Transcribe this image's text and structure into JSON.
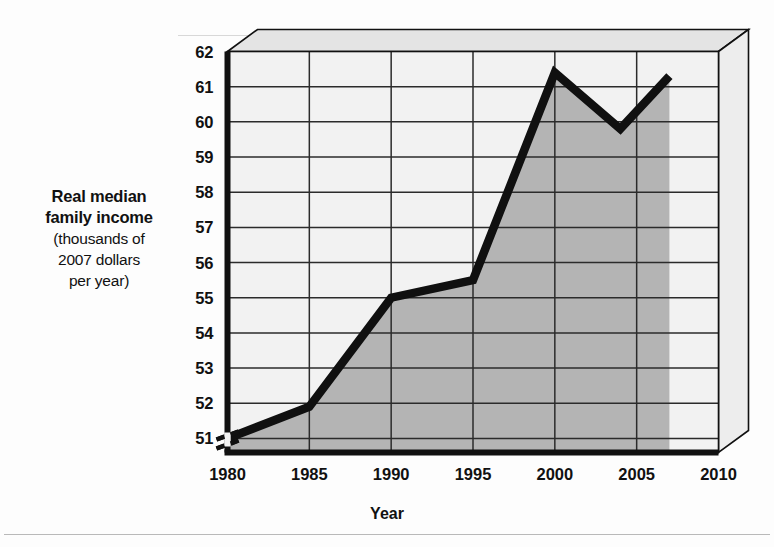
{
  "axes": {
    "y_title_bold": "Real median",
    "y_title_bold2": "family income",
    "y_title_plain1": "(thousands of",
    "y_title_plain2": "2007 dollars",
    "y_title_plain3": "per year)",
    "x_title": "Year"
  },
  "colors": {
    "line": "#101010",
    "fill": "#b4b4b4",
    "plot_background": "#f2f2f2",
    "bevel_top": "#e4e4e4",
    "bevel_side": "#ededed",
    "axis": "#111111",
    "grid": "#2b2b2b"
  },
  "chart_data": {
    "type": "area",
    "title": "",
    "xlabel": "Year",
    "ylabel": "Real median family income (thousands of 2007 dollars per year)",
    "x": [
      1980,
      1985,
      1990,
      1995,
      2000,
      2004,
      2007
    ],
    "values": [
      51.0,
      51.9,
      55.0,
      55.5,
      61.4,
      59.8,
      61.3
    ],
    "series": [
      {
        "name": "Real median family income",
        "x": [
          1980,
          1985,
          1990,
          1995,
          2000,
          2004,
          2007
        ],
        "values": [
          51.0,
          51.9,
          55.0,
          55.5,
          61.4,
          59.8,
          61.3
        ]
      }
    ],
    "xlim": [
      1980,
      2010
    ],
    "ylim": [
      50.6,
      62
    ],
    "xticks": [
      1980,
      1985,
      1990,
      1995,
      2000,
      2005,
      2010
    ],
    "xtick_labels": [
      "1980",
      "1985",
      "1990",
      "1995",
      "2000",
      "2005",
      "2010"
    ],
    "yticks": [
      51,
      52,
      53,
      54,
      55,
      56,
      57,
      58,
      59,
      60,
      61,
      62
    ],
    "ytick_labels": [
      "51",
      "52",
      "53",
      "54",
      "55",
      "56",
      "57",
      "58",
      "59",
      "60",
      "61",
      "62"
    ],
    "grid": true,
    "legend": "none",
    "axis_break": "y-axis break below 51",
    "style": "3d-beveled-plot-box",
    "fill_under_curve": true
  }
}
